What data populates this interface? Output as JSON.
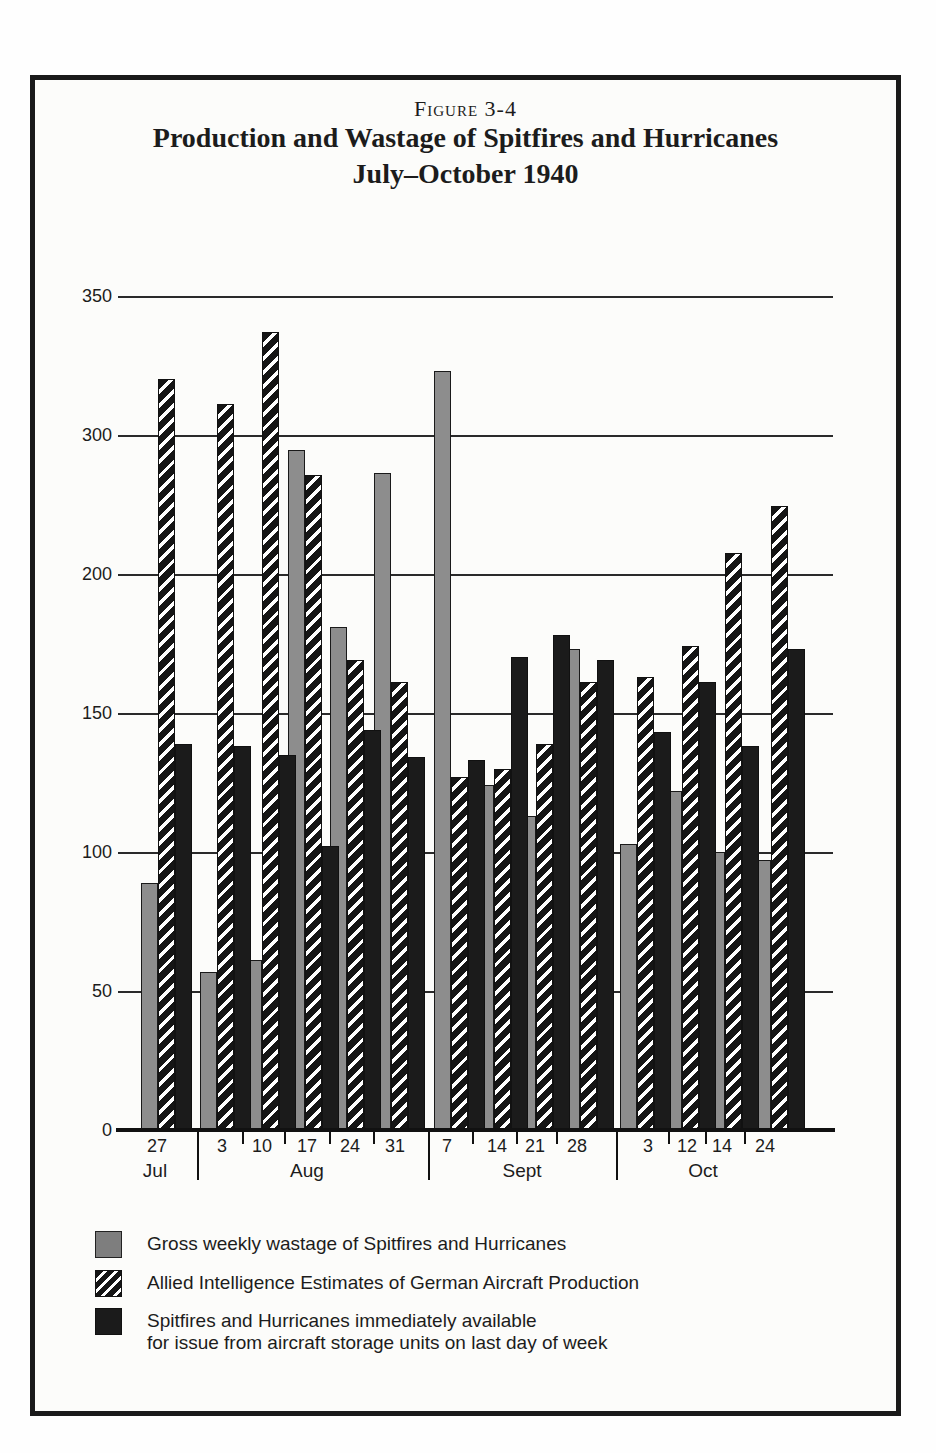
{
  "figure": {
    "label": "Figure 3-4",
    "title_line1": "Production and Wastage of Spitfires and Hurricanes",
    "title_line2": "July–October 1940"
  },
  "chart_data": {
    "type": "bar",
    "title": "Production and Wastage of Spitfires and Hurricanes July–October 1940",
    "xlabel": "",
    "ylabel": "",
    "y_tick_labels_as_printed": [
      "350",
      "300",
      "200",
      "150",
      "100",
      "50",
      "0"
    ],
    "y_axis_note": "gridlines evenly spaced but printed labels skip 250, so the 200-300 interval is compressed",
    "ylim": [
      0,
      350
    ],
    "grid": "horizontal",
    "legend_position": "below",
    "categories": [
      "27 Jul",
      "3 Aug",
      "10 Aug",
      "17 Aug",
      "24 Aug",
      "31 Aug",
      "7 Sept",
      "14 Sept",
      "21 Sept",
      "28 Sept",
      "3 Oct",
      "12 Oct",
      "14 Oct",
      "24 Oct"
    ],
    "months": [
      {
        "name": "Jul",
        "weeks": [
          "27"
        ]
      },
      {
        "name": "Aug",
        "weeks": [
          "3",
          "10",
          "17",
          "24",
          "31"
        ]
      },
      {
        "name": "Sept",
        "weeks": [
          "7",
          "14",
          "21",
          "28"
        ]
      },
      {
        "name": "Oct",
        "weeks": [
          "3",
          "12",
          "14",
          "24"
        ]
      }
    ],
    "series": [
      {
        "name": "Gross weekly wastage of Spitfires and Hurricanes",
        "style": "gray",
        "values": [
          89,
          57,
          61,
          289,
          181,
          273,
          323,
          124,
          113,
          173,
          103,
          122,
          100,
          97
        ]
      },
      {
        "name": "Allied Intelligence Estimates of German Aircraft Production",
        "style": "hatched",
        "values": [
          320,
          311,
          337,
          271,
          169,
          161,
          127,
          130,
          139,
          161,
          163,
          174,
          215,
          249
        ]
      },
      {
        "name": "Spitfires and Hurricanes immediately available for issue from aircraft storage units on last day of week",
        "style": "black",
        "values": [
          139,
          138,
          135,
          102,
          144,
          134,
          133,
          170,
          178,
          169,
          143,
          161,
          138,
          173
        ]
      }
    ]
  },
  "legend": {
    "items": [
      {
        "label": "Gross weekly wastage of Spitfires and Hurricanes",
        "label_line2": ""
      },
      {
        "label": "Allied Intelligence Estimates of German Aircraft Production",
        "label_line2": ""
      },
      {
        "label": "Spitfires and Hurricanes immediately available",
        "label_line2": "for issue from aircraft storage units on last day of week"
      }
    ]
  },
  "colors": {
    "bar_gray": "#8d8d8d",
    "bar_black": "#1b1b1b",
    "hatch_dark": "#151515",
    "hatch_light": "#ffffff",
    "line": "#1c1c1c",
    "frame": "#1a1a1a",
    "background": "#fcfcfa"
  }
}
